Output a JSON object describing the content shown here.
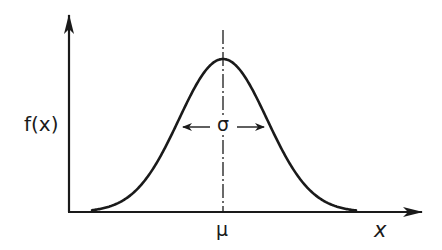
{
  "figure": {
    "type": "normal-distribution-diagram",
    "y_axis_label": "f(x)",
    "x_axis_label": "x",
    "mean_label": "μ",
    "std_label": "σ",
    "colors": {
      "ink": "#1a1a1a",
      "background": "#ffffff"
    }
  },
  "geometry": {
    "origin": [
      69,
      212
    ],
    "x_axis_end": [
      423,
      212
    ],
    "y_axis_end": [
      69,
      14
    ],
    "mean_x": 223,
    "peak_y": 59,
    "sigma_px": 44,
    "sigma_arrow_y": 127,
    "sigma_arrow_left_x": 182,
    "sigma_arrow_right_x": 265,
    "mean_line_top_y": 30
  }
}
